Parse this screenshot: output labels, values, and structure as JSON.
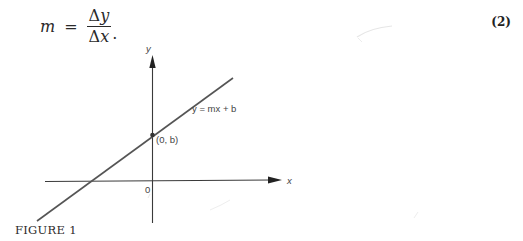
{
  "equation": {
    "lhs": "m",
    "equals": "=",
    "numerator_delta": "Δ",
    "numerator_var": "y",
    "denominator_delta": "Δ",
    "denominator_var": "x",
    "trailing": ".",
    "number": "(2)"
  },
  "figure": {
    "y_axis_label": "y",
    "x_axis_label": "x",
    "origin_label": "0",
    "intercept_label": "(0, b)",
    "line_label": "y = mx + b",
    "caption": "FIGURE 1"
  },
  "colors": {
    "ink": "#2a2a2a",
    "line": "#555555",
    "label": "#444444"
  }
}
